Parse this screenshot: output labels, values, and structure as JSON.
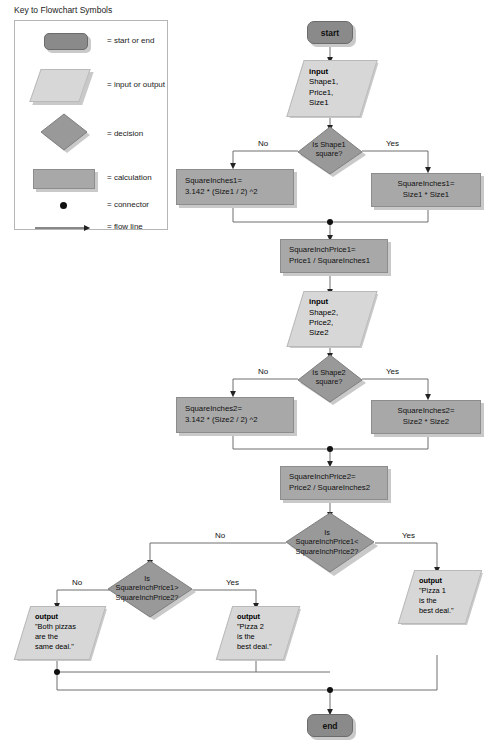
{
  "legend": {
    "title": "Key to Flowchart Symbols",
    "items": [
      {
        "symbol": "terminator",
        "label": "= start or end"
      },
      {
        "symbol": "parallelogram",
        "label": "= input or output"
      },
      {
        "symbol": "diamond",
        "label": "= decision"
      },
      {
        "symbol": "rectangle",
        "label": "= calculation"
      },
      {
        "symbol": "dot",
        "label": "= connector"
      },
      {
        "symbol": "arrow",
        "label": "= flow line"
      }
    ]
  },
  "colors": {
    "terminator": "#8a8a8a",
    "calculation": "#a8a8a8",
    "decision": "#999999",
    "io": "#d7d7d7",
    "shadow": "#c9c9c9",
    "line": "#6e6e6e"
  },
  "flowchart": {
    "title": "Pizza best-deal comparison flowchart",
    "start": "start",
    "end": "end",
    "input1": {
      "header": "input",
      "lines": [
        "Shape1,",
        "Price1,",
        "Size1"
      ]
    },
    "input2": {
      "header": "input",
      "lines": [
        "Shape2,",
        "Price2,",
        "Size2"
      ]
    },
    "decision1": {
      "lines": [
        "Is Shape1",
        "square?"
      ],
      "no": "No",
      "yes": "Yes"
    },
    "decision2": {
      "lines": [
        "Is Shape2",
        "square?"
      ],
      "no": "No",
      "yes": "Yes"
    },
    "decision3": {
      "lines": [
        "Is",
        "SquareInchPrice1<",
        "SquareInchPrice2?"
      ],
      "no": "No",
      "yes": "Yes"
    },
    "decision4": {
      "lines": [
        "Is",
        "SquareInchPrice1>",
        "SquareInchPrice2?"
      ],
      "no": "No",
      "yes": "Yes"
    },
    "calc1_no": {
      "lines": [
        "SquareInches1=",
        "3.142 * (Size1 / 2) ^2"
      ]
    },
    "calc1_yes": {
      "lines": [
        "SquareInches1=",
        "Size1 * Size1"
      ]
    },
    "calc_price1": {
      "lines": [
        "SquareInchPrice1=",
        "Price1 / SquareInches1"
      ]
    },
    "calc2_no": {
      "lines": [
        "SquareInches2=",
        "3.142 * (Size2 / 2) ^2"
      ]
    },
    "calc2_yes": {
      "lines": [
        "SquareInches2=",
        "Size2 * Size2"
      ]
    },
    "calc_price2": {
      "lines": [
        "SquareInchPrice2=",
        "Price2 / SquareInches2"
      ]
    },
    "output_same": {
      "header": "output",
      "lines": [
        "\"Both pizzas",
        "are the",
        "same deal.\""
      ]
    },
    "output_pizza2": {
      "header": "output",
      "lines": [
        "\"Pizza 2",
        "is the",
        "best deal.\""
      ]
    },
    "output_pizza1": {
      "header": "output",
      "lines": [
        "\"Pizza 1",
        "is the",
        "best deal.\""
      ]
    }
  }
}
